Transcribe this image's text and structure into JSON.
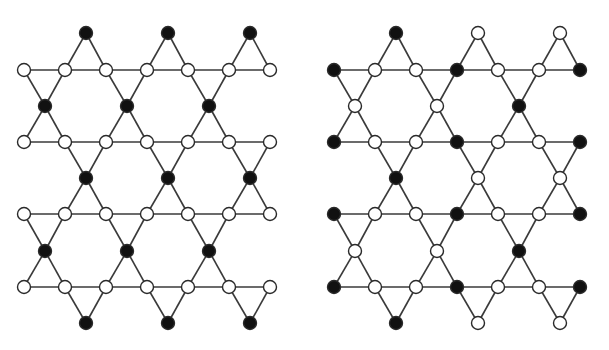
{
  "diagram": {
    "type": "kagome-lattice-comparison",
    "colors": {
      "filled": "#111111",
      "empty": "#ffffff",
      "edge": "#3a3a3a"
    },
    "node_radius": 6.5,
    "panels": [
      {
        "name": "left-lattice",
        "offset_x": 0,
        "rows": [
          {
            "y": 33,
            "kind": "apex",
            "xs": [
              86,
              168,
              250
            ],
            "states": [
              "B",
              "B",
              "B"
            ]
          },
          {
            "y": 70,
            "kind": "line",
            "xs": [
              24,
              65,
              106,
              147,
              188,
              229,
              270
            ],
            "states": [
              "W",
              "W",
              "W",
              "W",
              "W",
              "W",
              "W"
            ]
          },
          {
            "y": 106,
            "kind": "mid",
            "xs": [
              45,
              127,
              209
            ],
            "states": [
              "B",
              "B",
              "B"
            ]
          },
          {
            "y": 142,
            "kind": "line",
            "xs": [
              24,
              65,
              106,
              147,
              188,
              229,
              270
            ],
            "states": [
              "W",
              "W",
              "W",
              "W",
              "W",
              "W",
              "W"
            ]
          },
          {
            "y": 178,
            "kind": "mid",
            "xs": [
              86,
              168,
              250
            ],
            "states": [
              "B",
              "B",
              "B"
            ]
          },
          {
            "y": 214,
            "kind": "line",
            "xs": [
              24,
              65,
              106,
              147,
              188,
              229,
              270
            ],
            "states": [
              "W",
              "W",
              "W",
              "W",
              "W",
              "W",
              "W"
            ]
          },
          {
            "y": 251,
            "kind": "mid",
            "xs": [
              45,
              127,
              209
            ],
            "states": [
              "B",
              "B",
              "B"
            ]
          },
          {
            "y": 287,
            "kind": "line",
            "xs": [
              24,
              65,
              106,
              147,
              188,
              229,
              270
            ],
            "states": [
              "W",
              "W",
              "W",
              "W",
              "W",
              "W",
              "W"
            ]
          },
          {
            "y": 323,
            "kind": "apex",
            "xs": [
              86,
              168,
              250
            ],
            "states": [
              "B",
              "B",
              "B"
            ]
          }
        ]
      },
      {
        "name": "right-lattice",
        "offset_x": 310,
        "rows": [
          {
            "y": 33,
            "kind": "apex",
            "xs": [
              86,
              168,
              250
            ],
            "states": [
              "B",
              "W",
              "W"
            ]
          },
          {
            "y": 70,
            "kind": "line",
            "xs": [
              24,
              65,
              106,
              147,
              188,
              229,
              270
            ],
            "states": [
              "B",
              "W",
              "W",
              "B",
              "W",
              "W",
              "B"
            ]
          },
          {
            "y": 106,
            "kind": "mid",
            "xs": [
              45,
              127,
              209
            ],
            "states": [
              "W",
              "W",
              "B"
            ]
          },
          {
            "y": 142,
            "kind": "line",
            "xs": [
              24,
              65,
              106,
              147,
              188,
              229,
              270
            ],
            "states": [
              "B",
              "W",
              "W",
              "B",
              "W",
              "W",
              "B"
            ]
          },
          {
            "y": 178,
            "kind": "mid",
            "xs": [
              86,
              168,
              250
            ],
            "states": [
              "B",
              "W",
              "W"
            ]
          },
          {
            "y": 214,
            "kind": "line",
            "xs": [
              24,
              65,
              106,
              147,
              188,
              229,
              270
            ],
            "states": [
              "B",
              "W",
              "W",
              "B",
              "W",
              "W",
              "B"
            ]
          },
          {
            "y": 251,
            "kind": "mid",
            "xs": [
              45,
              127,
              209
            ],
            "states": [
              "W",
              "W",
              "B"
            ]
          },
          {
            "y": 287,
            "kind": "line",
            "xs": [
              24,
              65,
              106,
              147,
              188,
              229,
              270
            ],
            "states": [
              "B",
              "W",
              "W",
              "B",
              "W",
              "W",
              "B"
            ]
          },
          {
            "y": 323,
            "kind": "apex",
            "xs": [
              86,
              168,
              250
            ],
            "states": [
              "B",
              "W",
              "W"
            ]
          }
        ]
      }
    ]
  }
}
